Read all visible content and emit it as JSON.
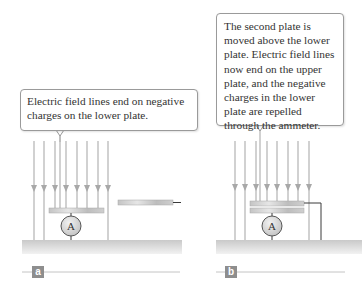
{
  "panels": [
    {
      "id": "a",
      "label": "a",
      "callout": "Electric field lines end on negative charges on the lower plate.",
      "ammeter_symbol": "A",
      "field_line_count": 8
    },
    {
      "id": "b",
      "label": "b",
      "callout": "The second plate is moved above the lower plate. Electric field lines now end on the upper plate, and the negative charges in the lower plate are repelled through the ammeter.",
      "ammeter_symbol": "A",
      "field_line_count": 8
    }
  ],
  "colors": {
    "field_line": "#b3b3b3",
    "plate": "#c8c8c8",
    "ground": "#d0d0d0",
    "wire": "#3a3a3a",
    "label_bg": "#8e8e8e"
  }
}
